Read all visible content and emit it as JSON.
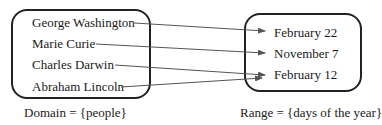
{
  "domain_set": {
    "items": [
      "George Washington",
      "Marie Curie",
      "Charles Darwin",
      "Abraham Lincoln"
    ],
    "caption": "Domain = {people}"
  },
  "range_set": {
    "items": [
      "February 22",
      "November 7",
      "February 12"
    ],
    "caption": "Range = {days of the year}"
  },
  "mappings": [
    {
      "from": "George Washington",
      "to": "February 22"
    },
    {
      "from": "Marie Curie",
      "to": "November 7"
    },
    {
      "from": "Charles Darwin",
      "to": "February 12"
    },
    {
      "from": "Abraham Lincoln",
      "to": "February 12"
    }
  ],
  "colors": {
    "box_border": "#222222",
    "arrow": "#555555",
    "text": "#1a1a1a"
  }
}
